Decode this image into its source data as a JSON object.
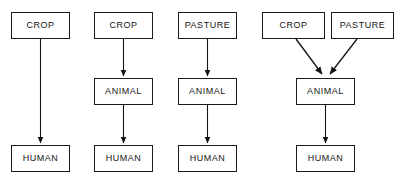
{
  "diagram": {
    "type": "flowchart",
    "width": 402,
    "height": 182,
    "background_color": "#ffffff",
    "box_border_color": "#1a1a1a",
    "box_fill_color": "#ffffff",
    "text_color": "#141414",
    "arrow_color": "#141414",
    "panels": [
      {
        "id": "panel-1",
        "name": "crop-to-human-direct",
        "nodes": [
          {
            "id": "p1-crop",
            "label": "CROP",
            "x": 11,
            "y": 12,
            "w": 59,
            "h": 27
          },
          {
            "id": "p1-human",
            "label": "HUMAN",
            "x": 11,
            "y": 145,
            "w": 59,
            "h": 27
          }
        ],
        "edges": [
          {
            "from": "p1-crop",
            "to": "p1-human",
            "x1": 40.5,
            "y1": 39,
            "x2": 40.5,
            "y2": 144
          }
        ]
      },
      {
        "id": "panel-2",
        "name": "crop-animal-human",
        "nodes": [
          {
            "id": "p2-crop",
            "label": "CROP",
            "x": 94,
            "y": 12,
            "w": 59,
            "h": 27
          },
          {
            "id": "p2-animal",
            "label": "ANIMAL",
            "x": 94,
            "y": 78,
            "w": 59,
            "h": 27
          },
          {
            "id": "p2-human",
            "label": "HUMAN",
            "x": 94,
            "y": 145,
            "w": 59,
            "h": 27
          }
        ],
        "edges": [
          {
            "from": "p2-crop",
            "to": "p2-animal",
            "x1": 123.5,
            "y1": 39,
            "x2": 123.5,
            "y2": 77
          },
          {
            "from": "p2-animal",
            "to": "p2-human",
            "x1": 123.5,
            "y1": 105,
            "x2": 123.5,
            "y2": 144
          }
        ]
      },
      {
        "id": "panel-3",
        "name": "pasture-animal-human",
        "nodes": [
          {
            "id": "p3-pasture",
            "label": "PASTURE",
            "x": 178,
            "y": 12,
            "w": 59,
            "h": 27
          },
          {
            "id": "p3-animal",
            "label": "ANIMAL",
            "x": 178,
            "y": 78,
            "w": 59,
            "h": 27
          },
          {
            "id": "p3-human",
            "label": "HUMAN",
            "x": 178,
            "y": 145,
            "w": 59,
            "h": 27
          }
        ],
        "edges": [
          {
            "from": "p3-pasture",
            "to": "p3-animal",
            "x1": 207.5,
            "y1": 39,
            "x2": 207.5,
            "y2": 77
          },
          {
            "from": "p3-animal",
            "to": "p3-human",
            "x1": 207.5,
            "y1": 105,
            "x2": 207.5,
            "y2": 144
          }
        ]
      },
      {
        "id": "panel-4",
        "name": "crop-and-pasture-animal-human",
        "nodes": [
          {
            "id": "p4-crop",
            "label": "CROP",
            "x": 262,
            "y": 12,
            "w": 63,
            "h": 27
          },
          {
            "id": "p4-pasture",
            "label": "PASTURE",
            "x": 331,
            "y": 12,
            "w": 63,
            "h": 27
          },
          {
            "id": "p4-animal",
            "label": "ANIMAL",
            "x": 296,
            "y": 78,
            "w": 59,
            "h": 27
          },
          {
            "id": "p4-human",
            "label": "HUMAN",
            "x": 296,
            "y": 145,
            "w": 59,
            "h": 27
          }
        ],
        "edges": [
          {
            "from": "p4-crop",
            "to": "p4-animal",
            "x1": 296,
            "y1": 39,
            "x2": 324,
            "y2": 76
          },
          {
            "from": "p4-pasture",
            "to": "p4-animal",
            "x1": 357,
            "y1": 39,
            "x2": 328,
            "y2": 76
          },
          {
            "from": "p4-animal",
            "to": "p4-human",
            "x1": 325.5,
            "y1": 105,
            "x2": 325.5,
            "y2": 144
          }
        ]
      }
    ]
  }
}
